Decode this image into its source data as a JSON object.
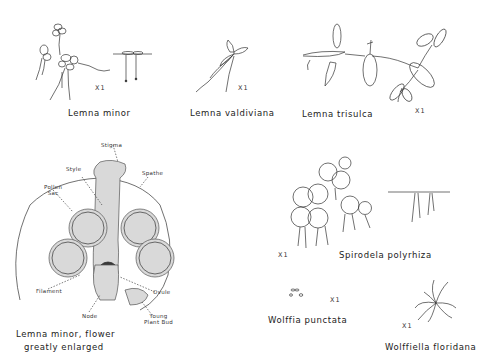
{
  "figure": {
    "specimens": [
      {
        "id": "lemna-minor",
        "name": "Lemna minor",
        "scale": "X1"
      },
      {
        "id": "lemna-valdiviana",
        "name": "Lemna valdiviana",
        "scale": "X1"
      },
      {
        "id": "lemna-trisulca",
        "name": "Lemna trisulca",
        "scale": "X1"
      },
      {
        "id": "lemna-minor-flower",
        "name_line1": "Lemna minor, flower",
        "name_line2": "greatly enlarged"
      },
      {
        "id": "spirodela-polyrhiza",
        "name": "Spirodela  polyrhiza",
        "scale": "X1"
      },
      {
        "id": "wolffia-punctata",
        "name": "Wolffia punctata",
        "scale": "X1"
      },
      {
        "id": "wolffiella-floridana",
        "name": "Wolffiella floridana",
        "scale": "X1"
      }
    ],
    "flower_parts": {
      "stigma": "Stigma",
      "style": "Style",
      "spathe": "Spathe",
      "pollen_sac_line1": "Pollen",
      "pollen_sac_line2": "Sac",
      "filament": "Filament",
      "ovule": "Ovule",
      "node": "Node",
      "young_bud_line1": "Young",
      "young_bud_line2": "Plant Bud"
    }
  }
}
